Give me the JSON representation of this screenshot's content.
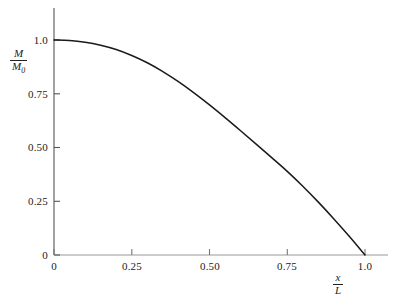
{
  "chart_data": {
    "type": "line",
    "title": "",
    "subtitle": "",
    "xlabel_numerator": "x",
    "xlabel_denominator": "L",
    "ylabel_numerator": "M",
    "ylabel_denominator": "M",
    "ylabel_denominator_sub": "0",
    "xlabel_plain": "x/L",
    "ylabel_plain": "M/M0",
    "xlim": [
      0,
      1.0
    ],
    "ylim": [
      0,
      1.0
    ],
    "grid": false,
    "legend": "none",
    "line_color": "#1a1a1a",
    "axis_color": "#555555",
    "xticks": [
      0,
      0.25,
      0.5,
      0.75,
      1.0
    ],
    "xtick_labels": [
      "0",
      "0.25",
      "0.50",
      "0.75",
      "1.0"
    ],
    "yticks": [
      0,
      0.25,
      0.5,
      0.75,
      1.0
    ],
    "ytick_labels": [
      "0",
      "0.25",
      "0.50",
      "0.75",
      "1.0"
    ],
    "series": [
      {
        "name": "M/M0",
        "x": [
          0.0,
          0.05,
          0.1,
          0.15,
          0.2,
          0.25,
          0.3,
          0.35,
          0.4,
          0.45,
          0.5,
          0.55,
          0.6,
          0.65,
          0.7,
          0.75,
          0.8,
          0.85,
          0.9,
          0.95,
          1.0
        ],
        "values": [
          1.0,
          0.998,
          0.99,
          0.976,
          0.956,
          0.928,
          0.894,
          0.853,
          0.806,
          0.754,
          0.698,
          0.639,
          0.578,
          0.516,
          0.453,
          0.389,
          0.32,
          0.246,
          0.168,
          0.086,
          0.0
        ]
      }
    ],
    "annotations": []
  }
}
